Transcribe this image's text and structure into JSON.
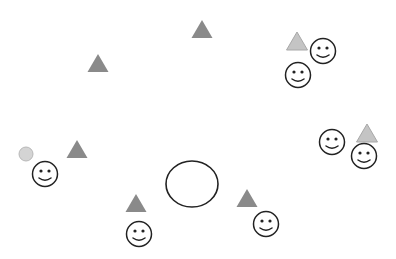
{
  "canvas": {
    "width": 396,
    "height": 259,
    "background": "#ffffff"
  },
  "colors": {
    "triangle_dark": "#8a8a8a",
    "triangle_light": "#c4c4c4",
    "triangle_light_stroke": "#a8a8a8",
    "small_circle_fill": "#d4d4d4",
    "small_circle_stroke": "#b8b8b8",
    "outline": "#222222"
  },
  "triangles_dark": [
    {
      "cx": 98,
      "cy": 63
    },
    {
      "cx": 202,
      "cy": 29
    },
    {
      "cx": 77,
      "cy": 149
    },
    {
      "cx": 136,
      "cy": 203
    },
    {
      "cx": 247,
      "cy": 198
    }
  ],
  "triangles_light": [
    {
      "cx": 297,
      "cy": 41
    },
    {
      "cx": 367,
      "cy": 133
    }
  ],
  "smileys": [
    {
      "cx": 323,
      "cy": 51
    },
    {
      "cx": 298,
      "cy": 75
    },
    {
      "cx": 45,
      "cy": 174
    },
    {
      "cx": 139,
      "cy": 234
    },
    {
      "cx": 266,
      "cy": 224
    },
    {
      "cx": 332,
      "cy": 142
    },
    {
      "cx": 364,
      "cy": 156
    }
  ],
  "small_circles": [
    {
      "cx": 26,
      "cy": 154,
      "r": 7
    }
  ],
  "ellipses": [
    {
      "cx": 192,
      "cy": 184,
      "rx": 26,
      "ry": 23
    }
  ]
}
